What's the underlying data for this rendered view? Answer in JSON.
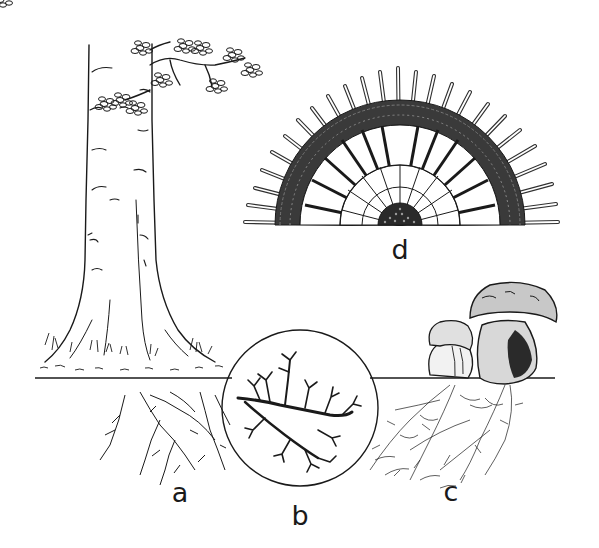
{
  "figure": {
    "colors": {
      "ink": "#1a1a1a",
      "paper": "#ffffff"
    },
    "panels": [
      {
        "id": "a",
        "label": "a",
        "depicts": "tree with root system below ground line",
        "label_pos": [
          180,
          492
        ]
      },
      {
        "id": "b",
        "label": "b",
        "depicts": "magnified branching root tips in circular inset",
        "label_pos": [
          300,
          515
        ]
      },
      {
        "id": "c",
        "label": "c",
        "depicts": "two bolete mushrooms with fungal mycelium network",
        "label_pos": [
          451,
          491
        ]
      },
      {
        "id": "d",
        "label": "d",
        "depicts": "cross-section of root with fungal mantle and hyphae (ectomycorrhiza)",
        "label_pos": [
          400,
          249
        ]
      }
    ]
  }
}
